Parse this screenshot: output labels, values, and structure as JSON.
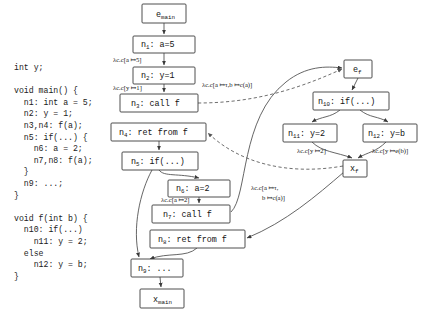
{
  "figure": {
    "type": "control-flow-graph",
    "background": "#ffffff",
    "node_stroke": "#3a3a3a",
    "edge_stroke": "#4a4a4a"
  },
  "code_listing": {
    "name": "source-code",
    "text": "int y;\n\nvoid main() {\n  n1: int a = 5;\n  n2: y = 1;\n  n3,n4: f(a);\n  n5: if(...) {\n    n6: a = 2;\n    n7,n8: f(a);\n  }\n  n9: ...;\n}\n\nvoid f(int b) {\n  n10: if(...)\n    n11: y = 2;\n  else\n    n12: y = b;\n}"
  },
  "nodes": [
    {
      "id": "e_main",
      "base": "e",
      "sub": "main",
      "label": "",
      "x": 142,
      "y": 4,
      "w": 44,
      "h": 19
    },
    {
      "id": "n1",
      "base": "n",
      "sub": "1",
      "label": ":  a=5",
      "x": 133,
      "y": 36,
      "w": 62,
      "h": 17
    },
    {
      "id": "n2",
      "base": "n",
      "sub": "2",
      "label": ":  y=1",
      "x": 133,
      "y": 67,
      "w": 62,
      "h": 17
    },
    {
      "id": "n3",
      "base": "n",
      "sub": "3",
      "label": ":  call f",
      "x": 120,
      "y": 94,
      "w": 78,
      "h": 18
    },
    {
      "id": "n4",
      "base": "n",
      "sub": "4",
      "label": ":  ret from f",
      "x": 111,
      "y": 123,
      "w": 95,
      "h": 18
    },
    {
      "id": "n5",
      "base": "n",
      "sub": "5",
      "label": ":  if(...)",
      "x": 122,
      "y": 152,
      "w": 76,
      "h": 18
    },
    {
      "id": "n6",
      "base": "n",
      "sub": "6",
      "label": ":  a=2",
      "x": 168,
      "y": 180,
      "w": 62,
      "h": 17
    },
    {
      "id": "n7",
      "base": "n",
      "sub": "7",
      "label": ":  call f",
      "x": 152,
      "y": 205,
      "w": 78,
      "h": 18
    },
    {
      "id": "n8",
      "base": "n",
      "sub": "8",
      "label": ":  ret from f",
      "x": 150,
      "y": 230,
      "w": 95,
      "h": 18
    },
    {
      "id": "n9",
      "base": "n",
      "sub": "9",
      "label": ":  ...",
      "x": 131,
      "y": 259,
      "w": 52,
      "h": 18
    },
    {
      "id": "x_main",
      "base": "x",
      "sub": "main",
      "label": "",
      "x": 140,
      "y": 289,
      "w": 44,
      "h": 19
    },
    {
      "id": "e_f",
      "base": "e",
      "sub": "f",
      "label": "",
      "x": 344,
      "y": 60,
      "w": 28,
      "h": 18
    },
    {
      "id": "n10",
      "base": "n",
      "sub": "10",
      "label": ":  if(...)",
      "x": 313,
      "y": 92,
      "w": 76,
      "h": 18
    },
    {
      "id": "n11",
      "base": "n",
      "sub": "11",
      "label": ":  y=2",
      "x": 283,
      "y": 124,
      "w": 54,
      "h": 18
    },
    {
      "id": "n12",
      "base": "n",
      "sub": "12",
      "label": ":  y=b",
      "x": 363,
      "y": 124,
      "w": 54,
      "h": 18
    },
    {
      "id": "x_f",
      "base": "x",
      "sub": "f",
      "label": "",
      "x": 343,
      "y": 160,
      "w": 24,
      "h": 17
    }
  ],
  "edge_labels": [
    {
      "name": "lambda-a-to-5",
      "text": "λc.c[a ↦5]",
      "x": 113,
      "y": 62,
      "lines": 1
    },
    {
      "name": "lambda-y-to-1",
      "text": "λc.c[y ↦1]",
      "x": 113,
      "y": 90,
      "lines": 1
    },
    {
      "name": "lambda-call-n3",
      "text": "λc.c[a ↦τ,b ↦c(a)]",
      "x": 202,
      "y": 87,
      "lines": 1
    },
    {
      "name": "lambda-a-to-2",
      "text": "λc.c[a ↦2]",
      "x": 161,
      "y": 202,
      "lines": 1
    },
    {
      "name": "lambda-call-n7-l1",
      "text": "λc.c[a ↦τ,",
      "x": 251,
      "y": 190,
      "lines": 2
    },
    {
      "name": "lambda-call-n7-l2",
      "text": "b ↦c(a)]",
      "x": 262,
      "y": 200,
      "lines": 2
    },
    {
      "name": "lambda-y-to-2",
      "text": "λc.c[y ↦2]",
      "x": 297,
      "y": 153,
      "lines": 1
    },
    {
      "name": "lambda-y-to-eb",
      "text": "λc.c[y ↦e(b)]",
      "x": 372,
      "y": 153,
      "lines": 1
    }
  ]
}
